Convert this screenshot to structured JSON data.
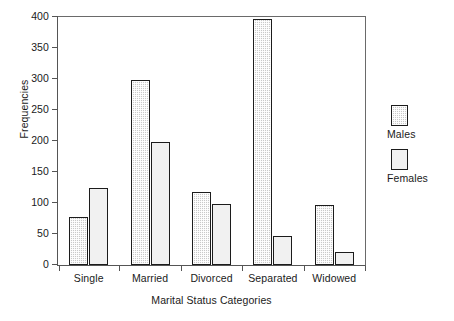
{
  "chart_data": {
    "type": "bar",
    "title": "",
    "subtitle": "",
    "xlabel": "Marital Status Categories",
    "ylabel": "Frequencies",
    "categories": [
      "Single",
      "Married",
      "Divorced",
      "Separated",
      "Widowed"
    ],
    "series": [
      {
        "name": "Males",
        "values": [
          78,
          299,
          118,
          396,
          97
        ],
        "color": "#c9c9c9",
        "fill": "halftone-gray"
      },
      {
        "name": "Females",
        "values": [
          124,
          198,
          98,
          46,
          21
        ],
        "color": "#f1f1f1",
        "fill": "solid-white"
      }
    ],
    "ylim": [
      0,
      400
    ],
    "ytick_labels": [
      "0",
      "50",
      "100",
      "150",
      "200",
      "250",
      "300",
      "350",
      "400"
    ],
    "ytick_values": [
      0,
      50,
      100,
      150,
      200,
      250,
      300,
      350,
      400
    ],
    "grid": false,
    "legend_position": "right",
    "frame": true,
    "axis_color": "#555555",
    "bar_edge_color": "#1c1c1c"
  },
  "legend": {
    "entries": [
      {
        "label": "Males"
      },
      {
        "label": "Females"
      }
    ]
  }
}
